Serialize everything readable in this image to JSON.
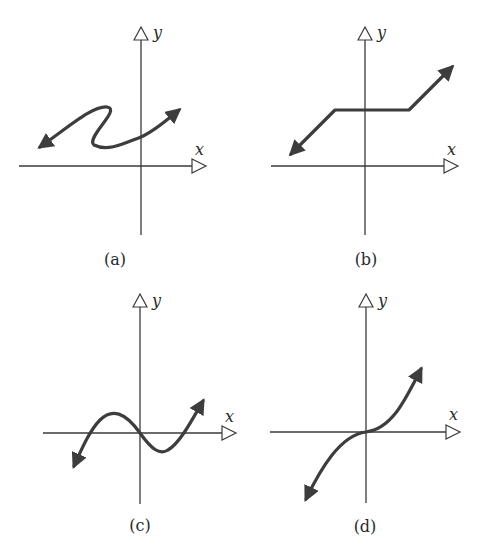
{
  "colors": {
    "background": "#ffffff",
    "axis": "#3a3a3a",
    "curve": "#3d3d3d"
  },
  "axes": {
    "x_label": "x",
    "y_label": "y"
  },
  "panels": [
    {
      "id": "a",
      "label": "(a)",
      "description": "S-shaped curve (not a function) with arrows at both ends, crossing the y-axis above origin"
    },
    {
      "id": "b",
      "label": "(b)",
      "description": "Piecewise linear: rising line, horizontal plateau across y-axis, rising line; arrows at both ends"
    },
    {
      "id": "c",
      "label": "(c)",
      "description": "Cubic-like curve crossing x-axis three times, through origin, local max left, local min right"
    },
    {
      "id": "d",
      "label": "(d)",
      "description": "Cubic y = x^3 style curve through origin with horizontal inflection"
    }
  ]
}
